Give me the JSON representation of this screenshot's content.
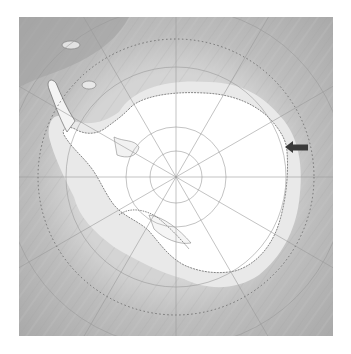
{
  "map": {
    "title": "",
    "projection": "south-polar-stereographic",
    "region": "Antarctica",
    "pole": {
      "x": 157,
      "y": 160
    },
    "colors": {
      "ocean_deep": "#a9a9a9",
      "ocean_shelf": "#cfcfcf",
      "ice_shelf": "#e6e6e6",
      "land_ice": "#ffffff",
      "graticule": "#9a9a9a",
      "circle_dotted": "#6a6a6a",
      "coastline": "#555555",
      "arrow": "#3a3a3a"
    },
    "graticule": {
      "latitude_circle_radii": [
        26,
        50,
        110,
        170
      ],
      "meridian_count": 12,
      "dotted_circle_radius": 138
    },
    "marker": {
      "type": "arrow",
      "direction": "left",
      "tip": {
        "x": 266,
        "y": 130
      },
      "label": ""
    }
  }
}
